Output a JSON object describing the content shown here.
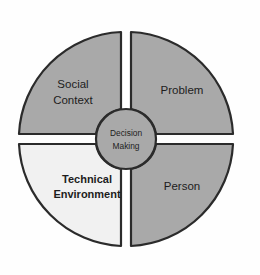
{
  "diagram": {
    "type": "four-quadrant-wheel",
    "center": {
      "label_line1": "Decision",
      "label_line2": "Making",
      "fill_color": "#a9a9a9",
      "border_color": "#2b2b2b"
    },
    "geometry": {
      "cx": 126,
      "cy": 139,
      "outer_radius": 107,
      "hub_radius": 30,
      "gap_half_width": 5
    },
    "quadrants": [
      {
        "id": "social-context",
        "position": "top-left",
        "label_line1": "Social",
        "label_line2": "Context",
        "fill_color": "#a9a9a9",
        "border_color": "#2b2b2b",
        "emphasis": false
      },
      {
        "id": "problem",
        "position": "top-right",
        "label_line1": "Problem",
        "label_line2": "",
        "fill_color": "#a9a9a9",
        "border_color": "#2b2b2b",
        "emphasis": false
      },
      {
        "id": "technical-environment",
        "position": "bottom-left",
        "label_line1": "Technical",
        "label_line2": "Environment",
        "fill_color": "#f1f1f1",
        "border_color": "#2b2b2b",
        "emphasis": true
      },
      {
        "id": "person",
        "position": "bottom-right",
        "label_line1": "Person",
        "label_line2": "",
        "fill_color": "#a9a9a9",
        "border_color": "#2b2b2b",
        "emphasis": false
      }
    ]
  }
}
